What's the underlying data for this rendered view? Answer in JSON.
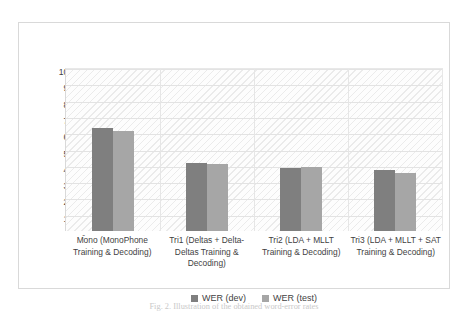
{
  "chart_data": {
    "type": "bar",
    "title": "",
    "xlabel": "",
    "ylabel": "",
    "ylim": [
      0,
      100
    ],
    "grid": true,
    "legend_position": "bottom",
    "categories": [
      "Mono (MonoPhone Training & Decoding)",
      "Tri1 (Deltas + Delta-Deltas Training & Decoding)",
      "Tri2 (LDA + MLLT Training & Decoding)",
      "Tri3 (LDA + MLLT + SAT Training & Decoding)"
    ],
    "series": [
      {
        "name": "WER (dev)",
        "color": "#7f7f7f",
        "values": [
          63.0,
          42.0,
          38.8,
          37.5
        ]
      },
      {
        "name": "WER (test)",
        "color": "#a6a6a6",
        "values": [
          61.5,
          41.3,
          39.3,
          35.3
        ]
      }
    ],
    "y_ticks": [
      "100.00",
      "90.00",
      "80.00",
      "70.00",
      "60.00",
      "50.00",
      "40.00",
      "30.00",
      "20.00",
      "10.00",
      "-"
    ]
  },
  "caption": "Fig. 2.   Illustration of the obtained word-error rates",
  "colors": {
    "dev": "#7f7f7f",
    "test": "#a6a6a6",
    "grid": "#e3e3e3",
    "frame": "#d9d9d9"
  }
}
